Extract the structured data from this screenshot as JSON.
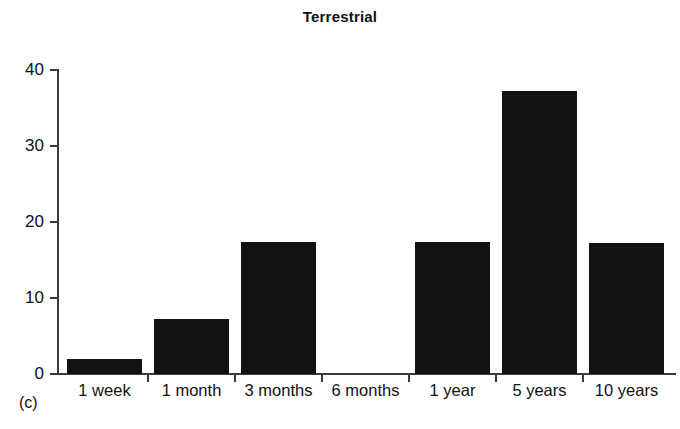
{
  "figure": {
    "panel_caption": "(c)",
    "background_color": "#ffffff",
    "bar_color": "#121212",
    "axis_color": "#3a3a3a"
  },
  "chart_data": {
    "type": "bar",
    "title": "Terrestrial",
    "xlabel": "",
    "ylabel": "",
    "categories": [
      "1 week",
      "1 month",
      "3 months",
      "6 months",
      "1 year",
      "5 years",
      "10 years"
    ],
    "values": [
      2,
      7.2,
      17.4,
      0,
      17.4,
      37.3,
      17.2
    ],
    "ylim": [
      0,
      40
    ],
    "yticks": [
      0,
      10,
      20,
      30,
      40
    ],
    "ytick_labels": [
      "0",
      "10",
      "20",
      "30",
      "40"
    ],
    "grid": false,
    "legend": null
  }
}
